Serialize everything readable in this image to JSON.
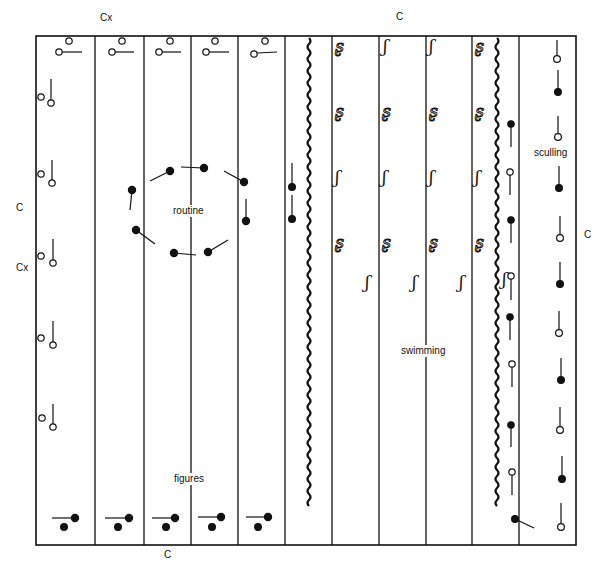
{
  "diagram": {
    "type": "pool-lane-layout",
    "outer_labels": {
      "top_left": "Cx",
      "top_right": "C",
      "left_upper": "C",
      "left_lower": "Cx",
      "right": "C",
      "bottom": "C"
    },
    "area_labels": {
      "routine": "routine",
      "figures": "figures",
      "swimming": "swimming",
      "sculling": "sculling"
    },
    "pool_bounds": {
      "left": 36,
      "top": 36,
      "right": 576,
      "bottom": 545
    },
    "lane_lines_x": [
      95,
      144,
      191,
      238,
      285,
      332,
      379,
      426,
      472,
      519
    ],
    "lane_ropes_x": [
      309,
      497
    ],
    "zones": [
      {
        "name": "figures",
        "lanes": 5,
        "x_range": [
          36,
          285
        ]
      },
      {
        "name": "routine",
        "x_range": [
          95,
          285
        ]
      },
      {
        "name": "swimming",
        "lanes": 4,
        "x_range": [
          309,
          497
        ]
      },
      {
        "name": "sculling",
        "x_range": [
          519,
          576
        ]
      }
    ],
    "symbols": {
      "open_circle": "open-circle-swimmer",
      "filled_circle": "filled-circle-swimmer",
      "stroke_glyph_open": "swimming-stroke-open-glyph",
      "stroke_glyph_filled": "swimming-stroke-filled-glyph"
    }
  }
}
